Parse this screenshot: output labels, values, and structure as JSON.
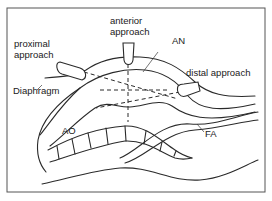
{
  "diagram": {
    "approaches": [
      {
        "id": "proximal",
        "label_line1": "proximal",
        "label_line2": "approach"
      },
      {
        "id": "anterior",
        "label_line1": "anterior",
        "label_line2": "approach"
      },
      {
        "id": "distal",
        "label": "distal  approach"
      }
    ],
    "structures": {
      "aneurysm": "AN",
      "aorta": "AO",
      "femoral_artery": "FA",
      "diaphragm": "Diaphragm"
    },
    "colors": {
      "line": "#2a2a2a",
      "background": "#ffffff",
      "frame": "#555555"
    }
  }
}
